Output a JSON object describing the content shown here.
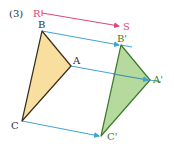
{
  "figure": {
    "number_label": "(3)",
    "vector": {
      "start_label": "R",
      "end_label": "S",
      "color": "#e0457b"
    },
    "original_triangle": {
      "labels": {
        "A": "A",
        "B": "B",
        "C": "C"
      },
      "fill": "#f8dfa0",
      "stroke": "#3a2e1e"
    },
    "image_triangle": {
      "labels": {
        "A": "A'",
        "B": "B'",
        "C": "C'"
      },
      "fill": "#a9d48c",
      "stroke": "#3d7a2e"
    },
    "translation_arrow_color": "#3ea3d8",
    "label_color": "#2f2f2f",
    "image_label_color": "#3d7a2e"
  }
}
